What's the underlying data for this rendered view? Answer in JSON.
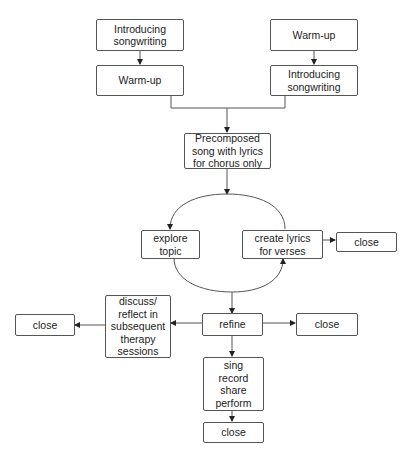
{
  "diagram": {
    "type": "flowchart",
    "colors": {
      "stroke": "#555555",
      "text": "#222222",
      "background": "#ffffff"
    },
    "nodes": {
      "intro_left": "Introducing\nsongwriting",
      "warmup_left": "Warm-up",
      "warmup_right": "Warm-up",
      "intro_right": "Introducing\nsongwriting",
      "precomposed": "Precomposed\nsong with lyrics\nfor chorus only",
      "explore": "explore\ntopic",
      "create_lyrics": "create lyrics\nfor verses",
      "close_create": "close",
      "discuss": "discuss/\nreflect in\nsubsequent\ntherapy\nsessions",
      "close_discuss": "close",
      "refine": "refine",
      "close_refine": "close",
      "sing": "sing\nrecord\nshare\nperform",
      "close_sing": "close"
    },
    "edges": [
      [
        "intro_left",
        "warmup_left"
      ],
      [
        "warmup_right",
        "intro_right"
      ],
      [
        "warmup_left",
        "precomposed"
      ],
      [
        "intro_right",
        "precomposed"
      ],
      [
        "precomposed",
        "explore"
      ],
      [
        "explore",
        "create_lyrics"
      ],
      [
        "create_lyrics",
        "explore"
      ],
      [
        "create_lyrics",
        "close_create"
      ],
      [
        "explore",
        "refine"
      ],
      [
        "refine",
        "discuss"
      ],
      [
        "discuss",
        "close_discuss"
      ],
      [
        "refine",
        "close_refine"
      ],
      [
        "refine",
        "sing"
      ],
      [
        "sing",
        "close_sing"
      ]
    ]
  }
}
